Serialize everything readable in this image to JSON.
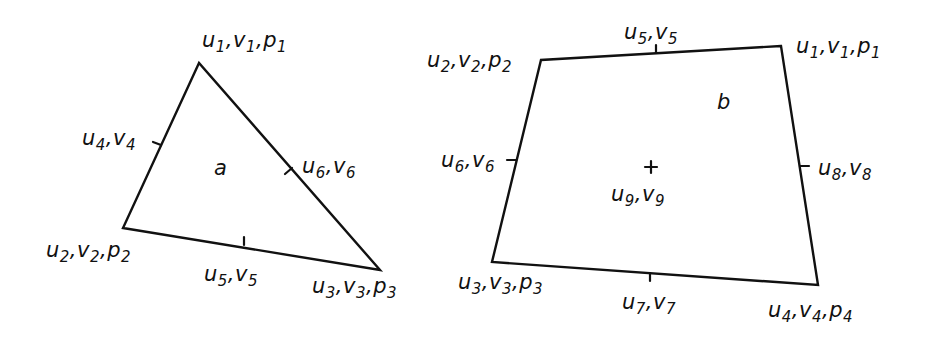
{
  "diagram": {
    "stroke_color": "#111111",
    "background": "#ffffff",
    "elements": [
      {
        "id": "a",
        "type": "triangle",
        "label": "a",
        "label_pos": [
          214,
          158
        ],
        "vertices": [
          [
            199,
            63
          ],
          [
            123,
            228
          ],
          [
            380,
            270
          ]
        ],
        "midpoint_ticks": [
          {
            "at": [
              161,
              145
            ],
            "dir": [
              -8,
              -3
            ]
          },
          {
            "at": [
              244,
              245
            ],
            "dir": [
              0,
              -8
            ]
          },
          {
            "at": [
              292,
              168
            ],
            "dir": [
              -7,
              6
            ]
          }
        ],
        "node_labels": [
          {
            "text": "u1,v1,p1",
            "parts": [
              [
                "u",
                "1"
              ],
              [
                "v",
                "1"
              ],
              [
                "p",
                "1"
              ]
            ],
            "pos": [
              202,
              30
            ]
          },
          {
            "text": "u2,v2,p2",
            "parts": [
              [
                "u",
                "2"
              ],
              [
                "v",
                "2"
              ],
              [
                "p",
                "2"
              ]
            ],
            "pos": [
              46,
              240
            ]
          },
          {
            "text": "u3,v3,p3",
            "parts": [
              [
                "u",
                "3"
              ],
              [
                "v",
                "3"
              ],
              [
                "p",
                "3"
              ]
            ],
            "pos": [
              312,
              276
            ]
          },
          {
            "text": "u4,v4",
            "parts": [
              [
                "u",
                "4"
              ],
              [
                "v",
                "4"
              ]
            ],
            "pos": [
              82,
              128
            ]
          },
          {
            "text": "u5,v5",
            "parts": [
              [
                "u",
                "5"
              ],
              [
                "v",
                "5"
              ]
            ],
            "pos": [
              204,
              264
            ]
          },
          {
            "text": "u6,v6",
            "parts": [
              [
                "u",
                "6"
              ],
              [
                "v",
                "6"
              ]
            ],
            "pos": [
              302,
              156
            ]
          }
        ]
      },
      {
        "id": "b",
        "type": "quadrilateral",
        "label": "b",
        "label_pos": [
          717,
          92
        ],
        "vertices": [
          [
            781,
            46
          ],
          [
            541,
            60
          ],
          [
            492,
            262
          ],
          [
            818,
            285
          ]
        ],
        "midpoint_ticks": [
          {
            "at": [
              656,
              53
            ],
            "dir": [
              0,
              -8
            ]
          },
          {
            "at": [
              516,
              160
            ],
            "dir": [
              -9,
              0
            ]
          },
          {
            "at": [
              650,
              273
            ],
            "dir": [
              0,
              8
            ]
          },
          {
            "at": [
              800,
              166
            ],
            "dir": [
              9,
              0
            ]
          }
        ],
        "center_marker": {
          "at": [
            651,
            167
          ],
          "size": 6
        },
        "node_labels": [
          {
            "text": "u1,v1,p1",
            "parts": [
              [
                "u",
                "1"
              ],
              [
                "v",
                "1"
              ],
              [
                "p",
                "1"
              ]
            ],
            "pos": [
              796,
              36
            ]
          },
          {
            "text": "u2,v2,p2",
            "parts": [
              [
                "u",
                "2"
              ],
              [
                "v",
                "2"
              ],
              [
                "p",
                "2"
              ]
            ],
            "pos": [
              427,
              50
            ]
          },
          {
            "text": "u3,v3,p3",
            "parts": [
              [
                "u",
                "3"
              ],
              [
                "v",
                "3"
              ],
              [
                "p",
                "3"
              ]
            ],
            "pos": [
              458,
              272
            ]
          },
          {
            "text": "u4,v4,p4",
            "parts": [
              [
                "u",
                "4"
              ],
              [
                "v",
                "4"
              ],
              [
                "p",
                "4"
              ]
            ],
            "pos": [
              768,
              300
            ]
          },
          {
            "text": "u5,v5",
            "parts": [
              [
                "u",
                "5"
              ],
              [
                "v",
                "5"
              ]
            ],
            "pos": [
              624,
              22
            ]
          },
          {
            "text": "u6,v6",
            "parts": [
              [
                "u",
                "6"
              ],
              [
                "v",
                "6"
              ]
            ],
            "pos": [
              441,
              150
            ]
          },
          {
            "text": "u7,v7",
            "parts": [
              [
                "u",
                "7"
              ],
              [
                "v",
                "7"
              ]
            ],
            "pos": [
              622,
              292
            ]
          },
          {
            "text": "u8,v8",
            "parts": [
              [
                "u",
                "8"
              ],
              [
                "v",
                "8"
              ]
            ],
            "pos": [
              818,
              158
            ]
          },
          {
            "text": "u9,v9",
            "parts": [
              [
                "u",
                "9"
              ],
              [
                "v",
                "9"
              ]
            ],
            "pos": [
              611,
              184
            ]
          }
        ]
      }
    ]
  }
}
